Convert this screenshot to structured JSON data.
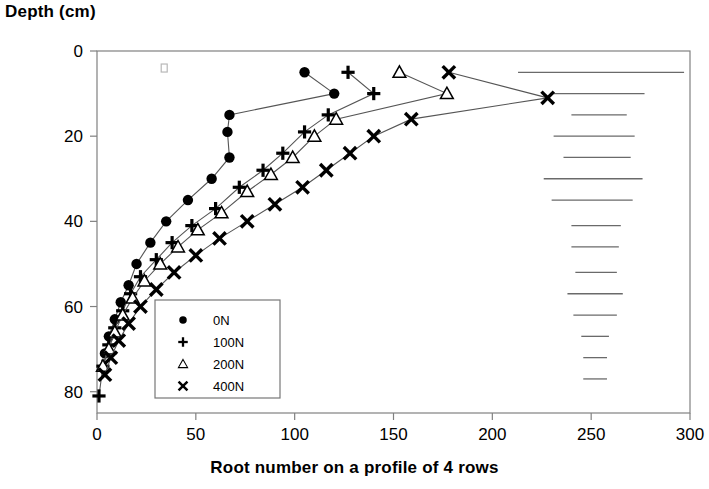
{
  "chart_data": {
    "type": "line",
    "title": "",
    "xlabel": "Root number on a profile of 4 rows",
    "ylabel": "Depth (cm)",
    "xlim": [
      0,
      300
    ],
    "ylim": [
      0,
      85
    ],
    "y_inverted": true,
    "grid": false,
    "x_ticks": [
      0,
      50,
      100,
      150,
      200,
      250,
      300
    ],
    "x_tick_labels": [
      "0",
      "50",
      "100",
      "150",
      "200",
      "250",
      "300"
    ],
    "y_ticks": [
      0,
      20,
      40,
      60,
      80
    ],
    "y_tick_labels": [
      "0",
      "20",
      "40",
      "60",
      "80"
    ],
    "legend_position": "lower-left-inside",
    "series": [
      {
        "name": "0N",
        "marker": "filled-circle",
        "x": [
          105,
          120,
          67,
          66,
          67,
          58,
          46,
          35,
          27,
          20,
          16,
          12,
          9,
          6,
          4
        ],
        "y": [
          5,
          10,
          15,
          19,
          25,
          30,
          35,
          40,
          45,
          50,
          55,
          59,
          63,
          67,
          71
        ]
      },
      {
        "name": "100N",
        "marker": "plus",
        "x": [
          127,
          140,
          117,
          105,
          94,
          84,
          72,
          60,
          48,
          38,
          30,
          22,
          17,
          13,
          9,
          6,
          3,
          1
        ],
        "y": [
          5,
          10,
          15,
          19,
          24,
          28,
          32,
          37,
          41,
          45,
          49,
          53,
          57,
          61,
          65,
          69,
          74,
          81
        ]
      },
      {
        "name": "200N",
        "marker": "open-triangle",
        "x": [
          153,
          177,
          121,
          110,
          99,
          88,
          76,
          63,
          51,
          41,
          32,
          24,
          18,
          13,
          9,
          6,
          3
        ],
        "y": [
          5,
          10,
          16,
          20,
          25,
          29,
          33,
          38,
          42,
          46,
          50,
          54,
          58,
          62,
          66,
          70,
          74
        ]
      },
      {
        "name": "400N",
        "marker": "cross-x",
        "x": [
          178,
          228,
          159,
          140,
          128,
          116,
          104,
          90,
          76,
          62,
          50,
          39,
          30,
          22,
          16,
          11,
          7,
          4
        ],
        "y": [
          5,
          11,
          16,
          20,
          24,
          28,
          32,
          36,
          40,
          44,
          48,
          52,
          56,
          60,
          64,
          68,
          72,
          76
        ]
      }
    ],
    "annotation_bars": {
      "description": "horizontal reference lines at right side of plot area",
      "unit": "root number",
      "bars": [
        {
          "depth": 5,
          "x_start": 213,
          "x_end": 297
        },
        {
          "depth": 10,
          "x_start": 230,
          "x_end": 277
        },
        {
          "depth": 15,
          "x_start": 240,
          "x_end": 268
        },
        {
          "depth": 20,
          "x_start": 231,
          "x_end": 272
        },
        {
          "depth": 25,
          "x_start": 236,
          "x_end": 270
        },
        {
          "depth": 30,
          "x_start": 226,
          "x_end": 276
        },
        {
          "depth": 35,
          "x_start": 230,
          "x_end": 271
        },
        {
          "depth": 41,
          "x_start": 240,
          "x_end": 265
        },
        {
          "depth": 46,
          "x_start": 240,
          "x_end": 264
        },
        {
          "depth": 52,
          "x_start": 242,
          "x_end": 263
        },
        {
          "depth": 57,
          "x_start": 238,
          "x_end": 266
        },
        {
          "depth": 62,
          "x_start": 241,
          "x_end": 263
        },
        {
          "depth": 67,
          "x_start": 245,
          "x_end": 259
        },
        {
          "depth": 72,
          "x_start": 246,
          "x_end": 258
        },
        {
          "depth": 77,
          "x_start": 246,
          "x_end": 258
        }
      ]
    },
    "stray_marker": {
      "x": 34,
      "y": 4,
      "shape": "small-open-square"
    },
    "colors": {
      "line": "#555555",
      "marker": "#000000",
      "axis": "#808080",
      "text": "#000000",
      "background": "#ffffff"
    }
  },
  "legend": {
    "entries": [
      {
        "label": "0N",
        "marker": "filled-circle"
      },
      {
        "label": "100N",
        "marker": "plus"
      },
      {
        "label": "200N",
        "marker": "open-triangle"
      },
      {
        "label": "400N",
        "marker": "cross-x"
      }
    ]
  }
}
